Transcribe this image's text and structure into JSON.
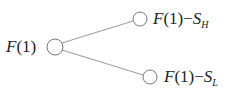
{
  "diagram": {
    "type": "tree",
    "root": {
      "label_fn": "F",
      "label_arg": "(1)"
    },
    "children": [
      {
        "label_fn": "F",
        "label_arg": "(1)",
        "op": "−",
        "sym": "S",
        "sub": "H"
      },
      {
        "label_fn": "F",
        "label_arg": "(1)",
        "op": "−",
        "sym": "S",
        "sub": "L"
      }
    ],
    "colors": {
      "line": "#999999",
      "node": "#777777",
      "text": "#222222"
    }
  }
}
